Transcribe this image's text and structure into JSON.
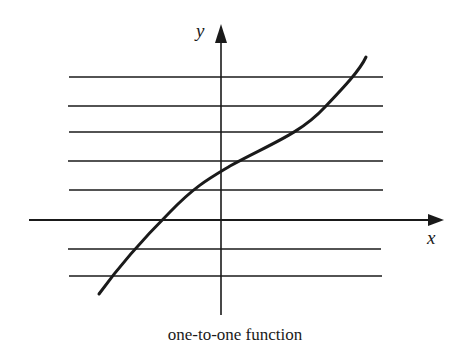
{
  "diagram": {
    "caption": "one-to-one function",
    "x_axis_label": "x",
    "y_axis_label": "y",
    "ink_color": "#1a1a1a",
    "horizontal_test_lines_y": [
      77,
      106,
      132,
      161,
      190,
      249,
      276
    ],
    "curve_description": "increasing curve passing horizontal line test; each horizontal line crosses the curve exactly once"
  }
}
